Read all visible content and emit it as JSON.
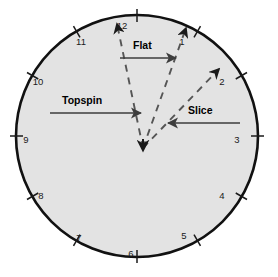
{
  "figure": {
    "name": "tennis-serve-clock-face-diagram",
    "background_color": "#ffffff"
  },
  "clock_face": {
    "fill_color": "#e3e3e3",
    "border_color": "#111111",
    "center_x": 137,
    "center_y": 136,
    "radius": 121,
    "border_width": 2.6,
    "numbers": [
      {
        "label": "12",
        "hour": 12,
        "angle_deg": 0,
        "tx": 122,
        "ty": 26
      },
      {
        "label": "1",
        "hour": 1,
        "angle_deg": 30,
        "tx": 182,
        "ty": 42
      },
      {
        "label": "2",
        "hour": 2,
        "angle_deg": 60,
        "tx": 222,
        "ty": 82
      },
      {
        "label": "3",
        "hour": 3,
        "angle_deg": 90,
        "tx": 237,
        "ty": 140
      },
      {
        "label": "4",
        "hour": 4,
        "angle_deg": 120,
        "tx": 222,
        "ty": 196
      },
      {
        "label": "5",
        "hour": 5,
        "angle_deg": 150,
        "tx": 184,
        "ty": 236
      },
      {
        "label": "6",
        "hour": 6,
        "angle_deg": 180,
        "tx": 131,
        "ty": 254
      },
      {
        "label": "7",
        "hour": 7,
        "angle_deg": 210,
        "tx": 79,
        "ty": 238
      },
      {
        "label": "8",
        "hour": 8,
        "angle_deg": 240,
        "tx": 41,
        "ty": 196
      },
      {
        "label": "9",
        "hour": 9,
        "angle_deg": 270,
        "tx": 26,
        "ty": 140
      },
      {
        "label": "10",
        "hour": 10,
        "angle_deg": 300,
        "tx": 38,
        "ty": 82
      },
      {
        "label": "11",
        "hour": 11,
        "angle_deg": 330,
        "tx": 81,
        "ty": 42
      }
    ]
  },
  "convergence_point": {
    "name": "ball-contact-point",
    "x": 143,
    "y": 148,
    "down_arrow_color": "#1a1a1a"
  },
  "spin_rays": [
    {
      "name": "topspin-ray",
      "target_hour": "11:30",
      "from_x": 143,
      "from_y": 148,
      "to_x": 117,
      "to_y": 24,
      "color": "#555555",
      "style": "dashed"
    },
    {
      "name": "flat-ray",
      "target_hour": "1:00",
      "from_x": 143,
      "from_y": 148,
      "to_x": 186,
      "to_y": 28,
      "color": "#555555",
      "style": "dashed"
    },
    {
      "name": "slice-ray",
      "target_hour": "2:00",
      "from_x": 143,
      "from_y": 148,
      "to_x": 219,
      "to_y": 69,
      "color": "#555555",
      "style": "dashed"
    }
  ],
  "annotations": [
    {
      "name": "topspin-annotation",
      "label": "Topspin",
      "label_x": 62,
      "label_y": 104,
      "arrow_from_x": 50,
      "arrow_from_y": 113,
      "arrow_to_x": 141,
      "arrow_to_y": 113,
      "direction": "right",
      "color": "#3d3d3d"
    },
    {
      "name": "flat-annotation",
      "label": "Flat",
      "label_x": 133,
      "label_y": 49,
      "arrow_from_x": 120,
      "arrow_from_y": 58,
      "arrow_to_x": 176,
      "arrow_to_y": 58,
      "direction": "right",
      "color": "#3d3d3d"
    },
    {
      "name": "slice-annotation",
      "label": "Slice",
      "label_x": 188,
      "label_y": 114,
      "arrow_from_x": 240,
      "arrow_from_y": 123,
      "arrow_to_x": 168,
      "arrow_to_y": 123,
      "direction": "left",
      "color": "#3d3d3d"
    }
  ]
}
